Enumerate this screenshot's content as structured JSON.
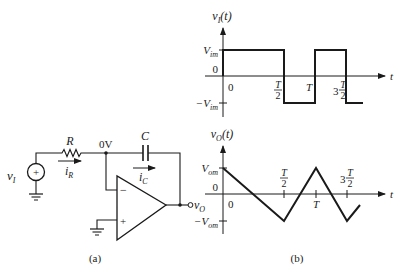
{
  "circuit": {
    "caption": "(a)",
    "source_label": "v",
    "source_sub": "I",
    "source_sign": "+",
    "resistor_label": "R",
    "current_r_label": "i",
    "current_r_sub": "R",
    "node_voltage_label": "0V",
    "capacitor_label": "C",
    "current_c_label": "i",
    "current_c_sub": "C",
    "opamp_minus": "−",
    "opamp_plus": "+",
    "output_label": "v",
    "output_sub": "O"
  },
  "waveforms": {
    "caption": "(b)",
    "input": {
      "ylabel": "v",
      "ylabel_sub": "I",
      "ylabel_suffix": "(t)",
      "xlabel": "t",
      "y_pos": "V",
      "y_pos_sub": "im",
      "y_zero": "0",
      "y_neg": "−V",
      "y_neg_sub": "im",
      "x_zero": "0",
      "x_half": "T",
      "x_half_den": "2",
      "x_T": "T",
      "x_three_half_coef": "3",
      "x_three_half": "T",
      "x_three_half_den": "2"
    },
    "output": {
      "ylabel": "v",
      "ylabel_sub": "O",
      "ylabel_suffix": "(t)",
      "xlabel": "t",
      "y_pos": "V",
      "y_pos_sub": "om",
      "y_zero": "0",
      "y_neg": "−V",
      "y_neg_sub": "om",
      "x_zero": "0",
      "x_half": "T",
      "x_half_den": "2",
      "x_T": "T",
      "x_three_half_coef": "3",
      "x_three_half": "T",
      "x_three_half_den": "2"
    }
  }
}
